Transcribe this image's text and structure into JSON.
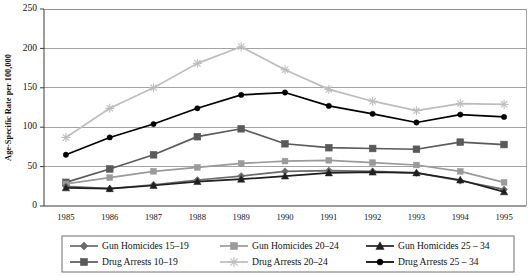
{
  "chart_data": {
    "type": "line",
    "title": "",
    "xlabel": "",
    "ylabel": "Age-Specific Rate per 100,000",
    "categories": [
      "1985",
      "1986",
      "1987",
      "1988",
      "1989",
      "1990",
      "1991",
      "1992",
      "1993",
      "1994",
      "1995"
    ],
    "ylim": [
      0,
      250
    ],
    "yticks": [
      0,
      50,
      100,
      150,
      200,
      250
    ],
    "grid": "horizontal",
    "legend_position": "bottom",
    "series": [
      {
        "name": "Gun Homicides 15–19",
        "marker": "diamond",
        "color": "#6b6b6b",
        "values": [
          25,
          22,
          27,
          33,
          38,
          44,
          45,
          44,
          42,
          32,
          21
        ]
      },
      {
        "name": "Gun Homicides 20–24",
        "marker": "square",
        "color": "#9a9a9a",
        "values": [
          28,
          36,
          44,
          49,
          54,
          57,
          58,
          55,
          52,
          44,
          30
        ]
      },
      {
        "name": "Gun Homicides 25 – 34",
        "marker": "triangle",
        "color": "#1f1f1f",
        "values": [
          23,
          22,
          26,
          31,
          34,
          38,
          42,
          43,
          42,
          33,
          18
        ]
      },
      {
        "name": "Drug Arrests 10–19",
        "marker": "square",
        "color": "#5a5a5a",
        "values": [
          30,
          47,
          65,
          88,
          98,
          79,
          74,
          73,
          72,
          81,
          78
        ]
      },
      {
        "name": "Drug Arrests 20–24",
        "marker": "asterisk",
        "color": "#bdbdbd",
        "values": [
          87,
          124,
          150,
          181,
          202,
          173,
          148,
          133,
          121,
          130,
          129
        ]
      },
      {
        "name": "Drug Arrests 25 – 34",
        "marker": "circle",
        "color": "#000000",
        "values": [
          65,
          87,
          104,
          124,
          141,
          144,
          127,
          117,
          106,
          116,
          113
        ]
      }
    ]
  },
  "legend": {
    "entries": [
      "Gun Homicides 15–19",
      "Gun Homicides 20–24",
      "Gun Homicides 25 – 34",
      "Drug Arrests 10–19",
      "Drug Arrests 20–24",
      "Drug Arrests 25 – 34"
    ]
  }
}
